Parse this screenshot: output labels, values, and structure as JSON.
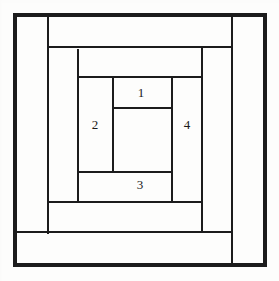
{
  "figure": {
    "kind": "nested-rectangles-diagram",
    "canvas": {
      "width": 279,
      "height": 281
    },
    "background_color": "#fdfdfc",
    "line_color": "#1c1c1c",
    "label_color": "#1a1a1a"
  },
  "outer_border": {
    "name": "outer-frame",
    "x1": 15,
    "y1": 15,
    "x2": 265,
    "y2": 265,
    "stroke_width": 3.2
  },
  "lines": [
    {
      "name": "line-vertical-outer-left",
      "orientation": "vertical",
      "x": 47.5,
      "from": 16,
      "to": 234,
      "stroke_width": 2.0
    },
    {
      "name": "line-vertical-mid-left",
      "orientation": "vertical",
      "x": 78.0,
      "from": 49,
      "to": 202,
      "stroke_width": 2.0
    },
    {
      "name": "line-vertical-inner-left",
      "orientation": "vertical",
      "x": 113.0,
      "from": 77,
      "to": 172,
      "stroke_width": 2.0
    },
    {
      "name": "line-vertical-inner-right",
      "orientation": "vertical",
      "x": 172.0,
      "from": 77,
      "to": 202,
      "stroke_width": 2.0
    },
    {
      "name": "line-vertical-mid-right",
      "orientation": "vertical",
      "x": 202.0,
      "from": 47,
      "to": 232,
      "stroke_width": 2.0
    },
    {
      "name": "line-vertical-outer-right",
      "orientation": "vertical",
      "x": 232.0,
      "from": 15,
      "to": 265,
      "stroke_width": 2.0
    },
    {
      "name": "line-horizontal-outer-top",
      "orientation": "horizontal",
      "y": 47.0,
      "from": 47,
      "to": 232,
      "stroke_width": 2.0
    },
    {
      "name": "line-horizontal-mid-top",
      "orientation": "horizontal",
      "y": 77.0,
      "from": 78,
      "to": 202,
      "stroke_width": 2.0
    },
    {
      "name": "line-horizontal-inner-top",
      "orientation": "horizontal",
      "y": 108.0,
      "from": 113,
      "to": 172,
      "stroke_width": 2.0
    },
    {
      "name": "line-horizontal-inner-bottom",
      "orientation": "horizontal",
      "y": 172.0,
      "from": 78,
      "to": 172,
      "stroke_width": 2.0
    },
    {
      "name": "line-horizontal-mid-bottom",
      "orientation": "horizontal",
      "y": 202.0,
      "from": 47,
      "to": 202,
      "stroke_width": 2.0
    },
    {
      "name": "line-horizontal-outer-bottom",
      "orientation": "horizontal",
      "y": 232.0,
      "from": 15,
      "to": 232,
      "stroke_width": 2.0
    }
  ],
  "labels": [
    {
      "name": "region-label-1",
      "text": "1",
      "x": 141,
      "y": 92
    },
    {
      "name": "region-label-2",
      "text": "2",
      "x": 95,
      "y": 124
    },
    {
      "name": "region-label-3",
      "text": "3",
      "x": 140,
      "y": 184
    },
    {
      "name": "region-label-4",
      "text": "4",
      "x": 187,
      "y": 124
    }
  ]
}
